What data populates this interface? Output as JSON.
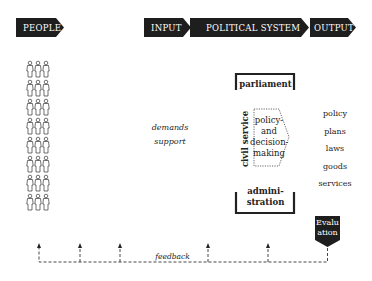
{
  "header": {
    "people": "PEOPLE",
    "input": "INPUT",
    "political_system": "POLITICAL SYSTEM",
    "output": "OUTPUT"
  },
  "people_icons": {
    "rows": 8,
    "per_row": 3,
    "icon": "person-group-icon"
  },
  "inputs": {
    "demands": "demands",
    "support": "support"
  },
  "system": {
    "parliament": "parliament",
    "civil_service": "civil service",
    "core_line1": "policy-",
    "core_line2": "and",
    "core_line3": "decision-",
    "core_line4": "making",
    "admin_line1": "admini-",
    "admin_line2": "stration"
  },
  "outputs": [
    "policy",
    "plans",
    "laws",
    "goods",
    "services"
  ],
  "evaluation": {
    "line1": "Evalu",
    "line2": "ation"
  },
  "feedback": {
    "label": "feedback"
  },
  "colors": {
    "dark": "#1e1e1e",
    "line": "#333333"
  }
}
